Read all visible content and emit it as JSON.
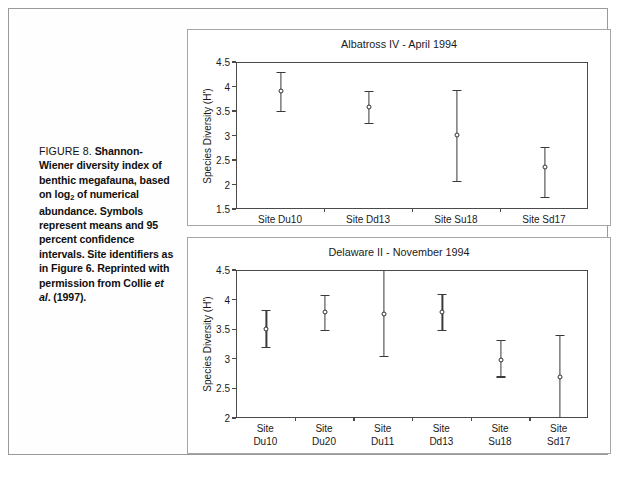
{
  "caption": {
    "lead": "FIGURE 8.",
    "body_html": "Shannon-Wiener diversity index of benthic megafauna, based on log<sub>2</sub> of numerical abundance. Symbols represent means and 95 percent confidence intervals. Site identifiers as in Figure 6. Reprinted with permission from Collie <span class=\"it\">et al</span>. (1997).",
    "body_text": "Shannon-Wiener diversity index of benthic megafauna, based on log2 of numerical abundance. Symbols represent means and 95 percent confidence intervals. Site identifiers as in Figure 6. Reprinted with permission from Collie et al. (1997)."
  },
  "chart_data": [
    {
      "type": "scatter",
      "id": "albatross-iv",
      "title": "Albatross IV - April 1994",
      "xlabel": "",
      "ylabel": "Species Diversity (H')",
      "ylim": [
        1.5,
        4.5
      ],
      "ytick_step": 0.5,
      "yticks": [
        "1.5",
        "2",
        "2.5",
        "3",
        "3.5",
        "4",
        "4.5"
      ],
      "ytick_values": [
        1.5,
        2,
        2.5,
        3,
        3.5,
        4,
        4.5
      ],
      "grid": false,
      "legend": "none",
      "label_lines": 1,
      "categories": [
        "Site Du10",
        "Site Dd13",
        "Site Su18",
        "Site Sd17"
      ],
      "values": [
        3.92,
        3.61,
        3.04,
        2.37
      ],
      "ci_low": [
        3.53,
        3.27,
        2.1,
        1.76
      ],
      "ci_high": [
        4.31,
        3.93,
        3.95,
        2.78
      ]
    },
    {
      "type": "scatter",
      "id": "delaware-ii",
      "title": "Delaware II - November 1994",
      "xlabel": "",
      "ylabel": "Species Diversity (H')",
      "ylim": [
        2,
        4.5
      ],
      "ytick_step": 0.5,
      "yticks": [
        "2",
        "2.5",
        "3",
        "3.5",
        "4",
        "4.5"
      ],
      "ytick_values": [
        2,
        2.5,
        3,
        3.5,
        4,
        4.5
      ],
      "grid": false,
      "legend": "none",
      "label_lines": 2,
      "categories": [
        "Site Du10",
        "Site Du20",
        "Site Du11",
        "Site Dd13",
        "Site Su18",
        "Site Sd17"
      ],
      "values": [
        3.52,
        3.81,
        3.77,
        3.8,
        2.99,
        2.71
      ],
      "ci_low": [
        3.22,
        3.51,
        3.06,
        3.5,
        2.72,
        2.04
      ],
      "ci_high": [
        3.84,
        4.1,
        4.7,
        4.11,
        3.33,
        3.42
      ]
    }
  ],
  "colors": {
    "ink": "#1a1a1a",
    "axis": "#4a4a4a",
    "marker_edge": "#2f2f2f",
    "panel_border": "#a6a6a6",
    "page_border": "#9a9a9a",
    "background": "#ffffff"
  }
}
